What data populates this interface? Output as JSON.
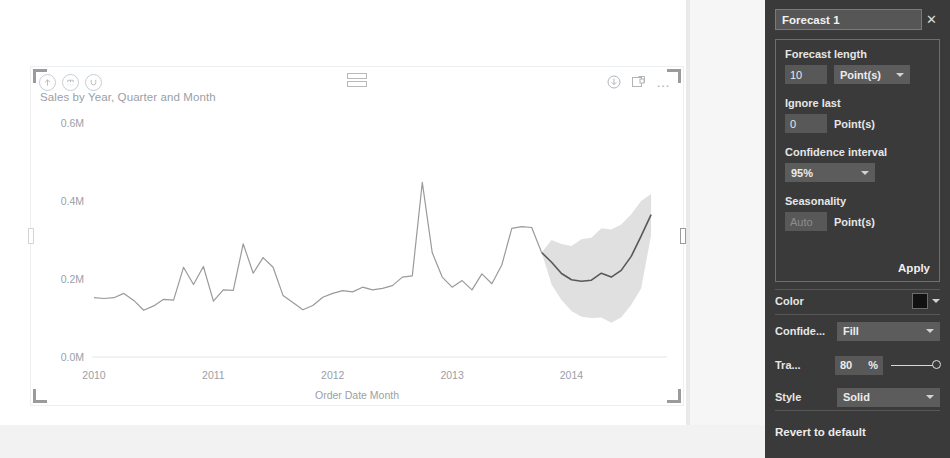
{
  "visual": {
    "title": "Sales by Year, Quarter and Month",
    "drill_icons": [
      {
        "name": "drill-up-icon",
        "glyph": "up-arrow"
      },
      {
        "name": "drill-down-expand-icon",
        "glyph": "fork-down"
      },
      {
        "name": "drill-mode-icon",
        "glyph": "drill"
      }
    ],
    "action_icons": [
      {
        "name": "export-data-icon",
        "glyph": "down-arrow-circle"
      },
      {
        "name": "focus-mode-icon",
        "glyph": "focus"
      },
      {
        "name": "more-options-icon",
        "glyph": "…"
      }
    ]
  },
  "chart_data": {
    "type": "line",
    "title": "Sales by Year, Quarter and Month",
    "xlabel": "Order Date Month",
    "ylabel": "",
    "ylim": [
      0,
      600000
    ],
    "ytick_labels": [
      "0.0M",
      "0.2M",
      "0.4M",
      "0.6M"
    ],
    "ytick_values": [
      0,
      200000,
      400000,
      600000
    ],
    "xtick_labels": [
      "2010",
      "2011",
      "2012",
      "2013",
      "2014"
    ],
    "grid": false,
    "legend": "none",
    "series": [
      {
        "name": "Sales (actual)",
        "color": "#9a9a9a",
        "values": [
          152000,
          150000,
          152000,
          163000,
          145000,
          120000,
          131000,
          148000,
          146000,
          230000,
          186000,
          232000,
          143000,
          172000,
          171000,
          290000,
          215000,
          255000,
          230000,
          158000,
          140000,
          121000,
          132000,
          153000,
          163000,
          170000,
          167000,
          179000,
          172000,
          176000,
          183000,
          205000,
          208000,
          448000,
          268000,
          205000,
          179000,
          196000,
          172000,
          213000,
          188000,
          236000,
          330000,
          334000,
          332000,
          268000
        ]
      },
      {
        "name": "Forecast",
        "color": "#585858",
        "values": [
          268000,
          243000,
          214000,
          198000,
          194000,
          197000,
          215000,
          205000,
          222000,
          258000,
          310000,
          365000
        ]
      }
    ],
    "confidence_band": {
      "level": "95%",
      "color": "#d6d6d6",
      "upper": [
        268000,
        300000,
        290000,
        285000,
        302000,
        306000,
        330000,
        327000,
        340000,
        366000,
        400000,
        418000
      ],
      "lower": [
        268000,
        186000,
        146000,
        118000,
        103000,
        100000,
        101000,
        88000,
        102000,
        133000,
        176000,
        312000
      ]
    }
  },
  "panel": {
    "title": "Forecast 1",
    "close_label": "✕",
    "forecast_length": {
      "label": "Forecast length",
      "value": "10",
      "unit_selected": "Point(s)"
    },
    "ignore_last": {
      "label": "Ignore last",
      "value": "0",
      "unit": "Point(s)"
    },
    "confidence_interval": {
      "label": "Confidence interval",
      "value": "95%"
    },
    "seasonality": {
      "label": "Seasonality",
      "value": "Auto",
      "unit": "Point(s)"
    },
    "apply_label": "Apply",
    "properties": [
      {
        "name": "Color",
        "type": "swatch",
        "value": "#111111"
      },
      {
        "name": "Confide...",
        "type": "select",
        "value": "Fill"
      },
      {
        "name": "Tra...",
        "type": "slider",
        "value": "80",
        "unit": "%"
      },
      {
        "name": "Style",
        "type": "select",
        "value": "Solid"
      }
    ],
    "revert_label": "Revert to default"
  }
}
